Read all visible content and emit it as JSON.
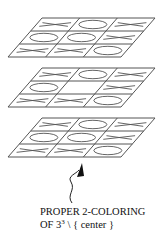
{
  "figure": {
    "layers": [
      {
        "name": "top",
        "grid": [
          [
            "X",
            "O",
            "X"
          ],
          [
            "O",
            "O",
            "X"
          ],
          [
            "X",
            "X",
            "O"
          ]
        ]
      },
      {
        "name": "middle",
        "grid": [
          [
            "X",
            "O",
            "X"
          ],
          [
            "O",
            "",
            "X"
          ],
          [
            "X",
            "X",
            "O"
          ]
        ]
      },
      {
        "name": "bottom",
        "grid": [
          [
            "X",
            "O",
            "X"
          ],
          [
            "O",
            "O",
            "X"
          ],
          [
            "X",
            "X",
            "O"
          ]
        ]
      }
    ],
    "line_color": "#555555",
    "arrow_color": "#111111"
  },
  "caption": {
    "line1": "PROPER 2-COLORING",
    "line2_prefix": "OF 3",
    "line2_sup": "3",
    "line2_suffix": " \\ { center }"
  }
}
